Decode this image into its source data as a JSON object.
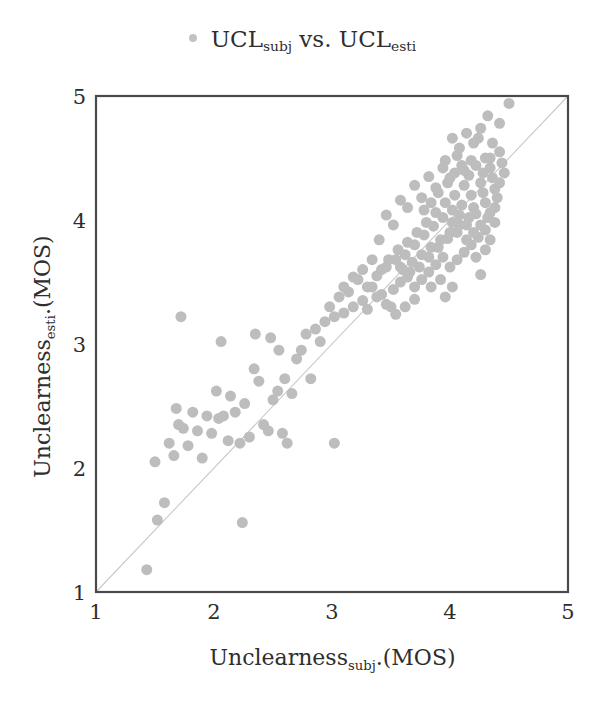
{
  "title": {
    "legend_marker": "legend-dot",
    "prefix": "UCL",
    "sub1": "subj",
    "middle": " vs. UCL",
    "sub2": "esti"
  },
  "axes": {
    "xlabel_main": "Unclearness",
    "xlabel_sub": "subj",
    "xlabel_suffix": ".(MOS)",
    "ylabel_main": "Unclearness",
    "ylabel_sub": "esti",
    "ylabel_suffix": ".(MOS)",
    "xticks": [
      "1",
      "2",
      "3",
      "4",
      "5"
    ],
    "yticks": [
      "1",
      "2",
      "3",
      "4",
      "5"
    ]
  },
  "colors": {
    "marker": "#bdbdbd",
    "axis": "#4a4a4a",
    "identity_line": "#c8c8c8",
    "background": "#ffffff",
    "text": "#2e2e2e"
  },
  "chart_data": {
    "type": "scatter",
    "xlabel": "Unclearness_subj.(MOS)",
    "ylabel": "Unclearness_esti.(MOS)",
    "xlim": [
      1,
      5
    ],
    "ylim": [
      1,
      5
    ],
    "xticks": [
      1,
      2,
      3,
      4,
      5
    ],
    "yticks": [
      1,
      2,
      3,
      4,
      5
    ],
    "grid": false,
    "legend": "UCL_subj vs. UCL_esti",
    "legend_position": "top-center",
    "marker_size": 11,
    "marker_color": "#bdbdbd",
    "reference_line": {
      "type": "identity",
      "x": [
        1,
        5
      ],
      "y": [
        1,
        5
      ],
      "color": "#c8c8c8"
    },
    "points": [
      [
        1.43,
        1.18
      ],
      [
        1.52,
        1.58
      ],
      [
        1.58,
        1.72
      ],
      [
        1.5,
        2.05
      ],
      [
        1.62,
        2.2
      ],
      [
        1.66,
        2.1
      ],
      [
        1.7,
        2.35
      ],
      [
        1.74,
        2.32
      ],
      [
        1.68,
        2.48
      ],
      [
        1.72,
        3.22
      ],
      [
        1.78,
        2.18
      ],
      [
        1.82,
        2.45
      ],
      [
        1.86,
        2.3
      ],
      [
        1.9,
        2.08
      ],
      [
        1.94,
        2.42
      ],
      [
        1.98,
        2.28
      ],
      [
        2.02,
        2.62
      ],
      [
        2.04,
        2.4
      ],
      [
        2.08,
        2.42
      ],
      [
        2.12,
        2.22
      ],
      [
        2.06,
        3.02
      ],
      [
        2.14,
        2.58
      ],
      [
        2.18,
        2.45
      ],
      [
        2.22,
        2.2
      ],
      [
        2.26,
        2.52
      ],
      [
        2.24,
        1.56
      ],
      [
        2.3,
        2.25
      ],
      [
        2.34,
        2.8
      ],
      [
        2.38,
        2.7
      ],
      [
        2.42,
        2.35
      ],
      [
        2.46,
        2.3
      ],
      [
        2.5,
        2.55
      ],
      [
        2.48,
        3.05
      ],
      [
        2.54,
        2.62
      ],
      [
        2.58,
        2.28
      ],
      [
        2.62,
        2.2
      ],
      [
        2.35,
        3.08
      ],
      [
        2.55,
        2.95
      ],
      [
        2.6,
        2.72
      ],
      [
        2.66,
        2.6
      ],
      [
        2.7,
        2.88
      ],
      [
        2.74,
        2.95
      ],
      [
        2.78,
        3.08
      ],
      [
        2.82,
        2.72
      ],
      [
        2.86,
        3.12
      ],
      [
        2.9,
        3.02
      ],
      [
        2.94,
        3.18
      ],
      [
        2.98,
        3.3
      ],
      [
        3.02,
        3.22
      ],
      [
        3.06,
        3.38
      ],
      [
        3.1,
        3.25
      ],
      [
        3.14,
        3.42
      ],
      [
        3.02,
        2.2
      ],
      [
        3.18,
        3.3
      ],
      [
        3.22,
        3.52
      ],
      [
        3.26,
        3.35
      ],
      [
        3.3,
        3.28
      ],
      [
        3.34,
        3.46
      ],
      [
        3.38,
        3.55
      ],
      [
        3.42,
        3.4
      ],
      [
        3.46,
        3.62
      ],
      [
        3.5,
        3.3
      ],
      [
        3.54,
        3.68
      ],
      [
        3.58,
        3.5
      ],
      [
        3.62,
        3.72
      ],
      [
        3.66,
        3.58
      ],
      [
        3.7,
        3.8
      ],
      [
        3.74,
        3.62
      ],
      [
        3.78,
        3.88
      ],
      [
        3.82,
        3.7
      ],
      [
        3.86,
        3.95
      ],
      [
        3.9,
        3.78
      ],
      [
        3.94,
        4.02
      ],
      [
        3.98,
        3.85
      ],
      [
        4.02,
        4.08
      ],
      [
        4.06,
        3.9
      ],
      [
        4.1,
        4.12
      ],
      [
        4.14,
        3.96
      ],
      [
        4.18,
        4.2
      ],
      [
        4.22,
        4.05
      ],
      [
        4.26,
        4.3
      ],
      [
        4.3,
        4.14
      ],
      [
        4.34,
        4.42
      ],
      [
        4.38,
        4.25
      ],
      [
        4.42,
        4.55
      ],
      [
        4.46,
        4.38
      ],
      [
        4.5,
        4.94
      ],
      [
        4.42,
        4.78
      ],
      [
        4.36,
        4.62
      ],
      [
        4.3,
        4.5
      ],
      [
        4.24,
        4.66
      ],
      [
        4.18,
        4.48
      ],
      [
        4.12,
        4.4
      ],
      [
        4.06,
        4.52
      ],
      [
        4.0,
        4.34
      ],
      [
        3.94,
        4.42
      ],
      [
        3.88,
        4.26
      ],
      [
        3.82,
        4.35
      ],
      [
        3.76,
        4.18
      ],
      [
        3.7,
        4.28
      ],
      [
        3.64,
        4.1
      ],
      [
        3.58,
        4.16
      ],
      [
        3.52,
        3.96
      ],
      [
        3.46,
        4.04
      ],
      [
        3.4,
        3.84
      ],
      [
        4.2,
        4.62
      ],
      [
        4.26,
        4.74
      ],
      [
        4.32,
        4.84
      ],
      [
        4.14,
        4.7
      ],
      [
        4.08,
        4.58
      ],
      [
        4.02,
        4.66
      ],
      [
        3.96,
        4.48
      ],
      [
        4.34,
        4.06
      ],
      [
        4.38,
        3.98
      ],
      [
        4.3,
        3.92
      ],
      [
        4.24,
        3.86
      ],
      [
        4.18,
        3.8
      ],
      [
        4.12,
        3.74
      ],
      [
        4.06,
        3.68
      ],
      [
        4.0,
        3.62
      ],
      [
        3.94,
        3.7
      ],
      [
        3.88,
        3.64
      ],
      [
        3.82,
        3.58
      ],
      [
        3.76,
        3.52
      ],
      [
        3.7,
        3.46
      ],
      [
        3.64,
        3.54
      ],
      [
        3.58,
        3.62
      ],
      [
        3.52,
        3.44
      ],
      [
        4.26,
        3.56
      ],
      [
        4.4,
        4.18
      ],
      [
        4.44,
        4.46
      ],
      [
        4.36,
        4.34
      ],
      [
        4.28,
        4.22
      ],
      [
        4.2,
        4.1
      ],
      [
        4.12,
        4.28
      ],
      [
        4.04,
        4.2
      ],
      [
        3.96,
        4.14
      ],
      [
        3.88,
        4.06
      ],
      [
        3.8,
        3.98
      ],
      [
        3.72,
        3.9
      ],
      [
        3.64,
        3.82
      ],
      [
        3.56,
        3.76
      ],
      [
        3.48,
        3.68
      ],
      [
        3.42,
        3.6
      ],
      [
        4.16,
        4.02
      ],
      [
        4.08,
        3.96
      ],
      [
        4.0,
        3.9
      ],
      [
        3.92,
        3.84
      ],
      [
        3.84,
        3.78
      ],
      [
        3.76,
        3.72
      ],
      [
        3.68,
        3.66
      ],
      [
        3.6,
        3.6
      ],
      [
        4.22,
        3.7
      ],
      [
        4.3,
        3.76
      ],
      [
        4.34,
        3.84
      ],
      [
        3.92,
        3.52
      ],
      [
        3.84,
        3.46
      ],
      [
        3.96,
        3.38
      ],
      [
        4.02,
        3.46
      ],
      [
        3.7,
        3.36
      ],
      [
        3.62,
        3.3
      ],
      [
        3.54,
        3.24
      ],
      [
        3.46,
        3.32
      ],
      [
        3.38,
        3.38
      ],
      [
        3.3,
        3.46
      ],
      [
        3.26,
        3.6
      ],
      [
        3.18,
        3.54
      ],
      [
        3.34,
        3.68
      ],
      [
        3.1,
        3.46
      ],
      [
        4.1,
        4.44
      ],
      [
        4.04,
        4.38
      ],
      [
        3.98,
        4.3
      ],
      [
        4.16,
        4.36
      ],
      [
        4.22,
        4.44
      ],
      [
        4.28,
        4.38
      ],
      [
        4.34,
        4.5
      ],
      [
        3.9,
        4.22
      ],
      [
        3.84,
        4.14
      ],
      [
        3.78,
        4.08
      ],
      [
        4.42,
        4.3
      ],
      [
        4.38,
        4.1
      ],
      [
        4.32,
        4.02
      ],
      [
        4.26,
        3.96
      ],
      [
        4.2,
        3.9
      ],
      [
        4.14,
        3.84
      ],
      [
        4.08,
        4.04
      ],
      [
        4.02,
        3.98
      ]
    ]
  }
}
